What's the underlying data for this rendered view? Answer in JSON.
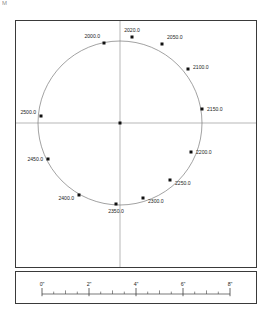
{
  "artifact": {
    "mark": "M"
  },
  "plot": {
    "axes": {
      "vertical_line": "vertical-crosshair",
      "horizontal_line": "horizontal-crosshair",
      "color": "#9a9a9a"
    },
    "center_point": {
      "name": "center-marker",
      "cx": 104,
      "cy": 102
    },
    "curve": {
      "type": "ellipse",
      "cx": 104,
      "cy": 102,
      "rx": 82,
      "ry": 82,
      "stroke": "#7a7a7a"
    },
    "point_color": "#111111",
    "points": [
      {
        "label": "2000.0",
        "cx": 88,
        "cy": 22,
        "tx": 84,
        "ty": 17,
        "anchor": "end"
      },
      {
        "label": "2020.0",
        "cx": 116,
        "cy": 16,
        "tx": 116,
        "ty": 11,
        "anchor": "middle"
      },
      {
        "label": "2050.0",
        "cx": 146,
        "cy": 23,
        "tx": 151,
        "ty": 18,
        "anchor": "start"
      },
      {
        "label": "2100.0",
        "cx": 172,
        "cy": 48,
        "tx": 177,
        "ty": 48,
        "anchor": "start"
      },
      {
        "label": "2150.0",
        "cx": 186,
        "cy": 88,
        "tx": 191,
        "ty": 90,
        "anchor": "start"
      },
      {
        "label": "2200.0",
        "cx": 175,
        "cy": 131,
        "tx": 180,
        "ty": 133,
        "anchor": "start"
      },
      {
        "label": "2250.0",
        "cx": 154,
        "cy": 159,
        "tx": 159,
        "ty": 164,
        "anchor": "start"
      },
      {
        "label": "2300.0",
        "cx": 127,
        "cy": 177,
        "tx": 132,
        "ty": 182,
        "anchor": "start"
      },
      {
        "label": "2350.0",
        "cx": 100,
        "cy": 183,
        "tx": 100,
        "ty": 192,
        "anchor": "middle"
      },
      {
        "label": "2400.0",
        "cx": 63,
        "cy": 174,
        "tx": 58,
        "ty": 179,
        "anchor": "end"
      },
      {
        "label": "2450.0",
        "cx": 32,
        "cy": 138,
        "tx": 27,
        "ty": 140,
        "anchor": "end"
      },
      {
        "label": "2500.0",
        "cx": 25,
        "cy": 95,
        "tx": 20,
        "ty": 93,
        "anchor": "end"
      }
    ]
  },
  "scale_bar": {
    "axis_name": "scale-axis",
    "unit": "inches",
    "stroke": "#3f3f3f",
    "major_ticks": [
      {
        "label": "0\"",
        "x": 26
      },
      {
        "label": "2\"",
        "x": 73
      },
      {
        "label": "4\"",
        "x": 120
      },
      {
        "label": "6\"",
        "x": 167
      },
      {
        "label": "8\"",
        "x": 214
      }
    ],
    "minor_ticks": [
      49.5,
      96.5,
      143.5,
      190.5
    ],
    "quarter_ticks": [
      37.7,
      61.3,
      84.7,
      108.3,
      131.7,
      155.3,
      178.7,
      202.3
    ]
  },
  "chart_data": {
    "type": "scatter",
    "title": "",
    "xlabel": "",
    "ylabel": "",
    "grid": false,
    "legend": "none",
    "series": [
      {
        "name": "station-points",
        "labels": [
          "2000.0",
          "2020.0",
          "2050.0",
          "2100.0",
          "2150.0",
          "2200.0",
          "2250.0",
          "2300.0",
          "2350.0",
          "2400.0",
          "2450.0",
          "2500.0"
        ],
        "values": [
          2000.0,
          2020.0,
          2050.0,
          2100.0,
          2150.0,
          2200.0,
          2250.0,
          2300.0,
          2350.0,
          2400.0,
          2450.0,
          2500.0
        ]
      }
    ],
    "scale_ticks": [
      "0\"",
      "2\"",
      "4\"",
      "6\"",
      "8\""
    ],
    "scale_unit": "inches"
  }
}
